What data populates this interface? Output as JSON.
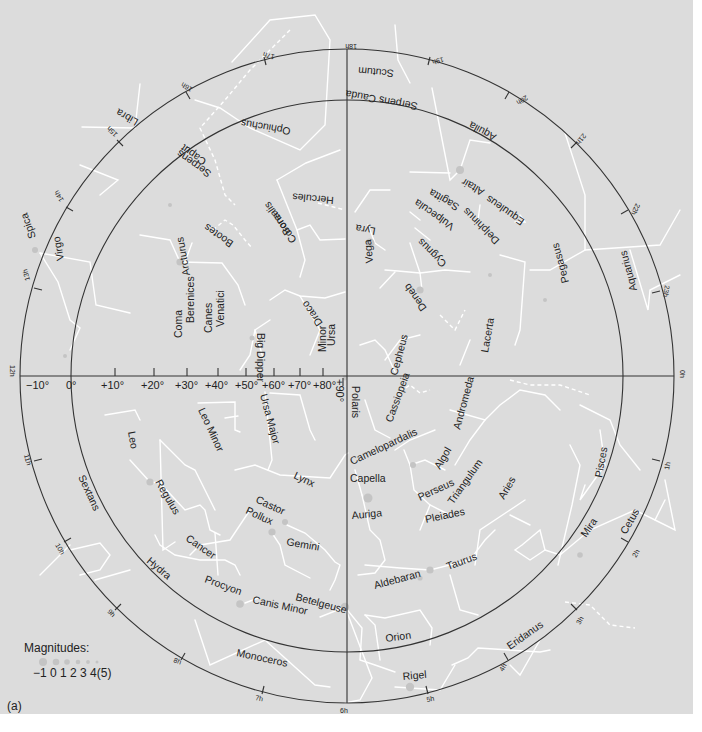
{
  "figure_label": "(a)",
  "legend": {
    "title": "Magnitudes:",
    "values": "−1 0 1 2 3 4(5)",
    "dot_sizes": [
      5,
      4.2,
      3.6,
      3,
      2.4,
      1.8,
      1.3
    ]
  },
  "colors": {
    "background": "#dcdcdc",
    "circles": "#333333",
    "constellation_lines": "#ffffff",
    "stars": "#c4c4c4"
  },
  "declination_labels": [
    "−10°",
    "0°",
    "+10°",
    "+20°",
    "+30°",
    "+40°",
    "+50°",
    "+60°",
    "+70°",
    "+80°",
    "+90°"
  ],
  "hour_labels": {
    "h0": "0",
    "h1": "1",
    "h2": "2",
    "h3": "3",
    "h4": "4",
    "h5": "5",
    "h6": "6",
    "h7": "7",
    "h8": "8",
    "h9": "9",
    "h10": "10",
    "h11": "11",
    "h12": "12",
    "h13": "13",
    "h14": "14",
    "h15": "15",
    "h16": "16",
    "h17": "17",
    "h18": "18",
    "h19": "19",
    "h20": "20",
    "h21": "21",
    "h22": "22",
    "h23": "23",
    "suffix": "h"
  },
  "constellations": {
    "scutum": "Scutum",
    "serpens_cauda": "Serpens Cauda",
    "ophiuchus": "Ophiuchus",
    "aquila": "Aquila",
    "serpens_caput_1": "Serpens",
    "serpens_caput_2": "Caput",
    "libra": "Libra",
    "hercules": "Hercules",
    "equuleus": "Equuleus",
    "sagitta": "Sagitta",
    "vulpecula": "Vulpecula",
    "delphinus": "Delphinus",
    "lyra": "Lyra",
    "corona_1": "Corona",
    "corona_2": "Borealis",
    "bootes": "Bootes",
    "cygnus": "Cygnus",
    "pegasus": "Pegasus",
    "aquarius": "Aquarius",
    "virgo": "Virgo",
    "canes_1": "Canes",
    "canes_2": "Venatici",
    "coma_1": "Coma",
    "coma_2": "Berenices",
    "draco": "Draco",
    "ursa_minor_1": "Ursa",
    "ursa_minor_2": "Minor",
    "cepheus": "Cepheus",
    "lacerta": "Lacerta",
    "cassiopeia": "Cassiopeia",
    "andromeda": "Andromeda",
    "ursa_major": "Ursa Major",
    "leo_minor": "Leo Minor",
    "leo": "Leo",
    "camelopardalis": "Camelopardalis",
    "perseus": "Perseus",
    "triangulum": "Triangulum",
    "aries": "Aries",
    "pisces": "Pisces",
    "lynx": "Lynx",
    "sextans": "Sextans",
    "auriga": "Auriga",
    "gemini": "Gemini",
    "cancer": "Cancer",
    "hydra": "Hydra",
    "taurus": "Taurus",
    "cetus": "Cetus",
    "canis_minor": "Canis Minor",
    "orion": "Orion",
    "eridanus": "Eridanus",
    "monoceros": "Monoceros"
  },
  "stars": {
    "spica": "Spica",
    "altair": "Altair",
    "vega": "Vega",
    "arcturus": "Arcturus",
    "deneb": "Deneb",
    "big_dipper": "Big Dipper",
    "polaris": "Polaris",
    "capella": "Capella",
    "algol": "Algol",
    "regulus": "Regulus",
    "castor": "Castor",
    "pollux": "Pollux",
    "pleiades": "Pleiades",
    "aldebaran": "Aldebaran",
    "mira": "Mira",
    "procyon": "Procyon",
    "betelgeuse": "Betelgeuse",
    "rigel": "Rigel"
  }
}
